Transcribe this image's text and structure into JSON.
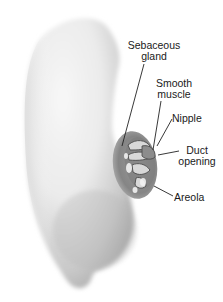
{
  "figure": {
    "colors": {
      "skin_light": "#f4f4f4",
      "skin_mid": "#d9d9d9",
      "skin_shadow": "#a8a8a8",
      "areola": "#8a8a8a",
      "areola_inner": "#6e6e6e",
      "leader_line": "#222222",
      "label_text": "#1a1a1a"
    }
  },
  "labels": [
    {
      "id": "sebaceous-gland",
      "line1": "Sebaceous",
      "line2": "gland"
    },
    {
      "id": "smooth-muscle",
      "line1": "Smooth",
      "line2": "muscle"
    },
    {
      "id": "nipple",
      "line1": "Nipple"
    },
    {
      "id": "duct-opening",
      "line1": "Duct",
      "line2": "opening"
    },
    {
      "id": "areola",
      "line1": "Areola"
    }
  ]
}
